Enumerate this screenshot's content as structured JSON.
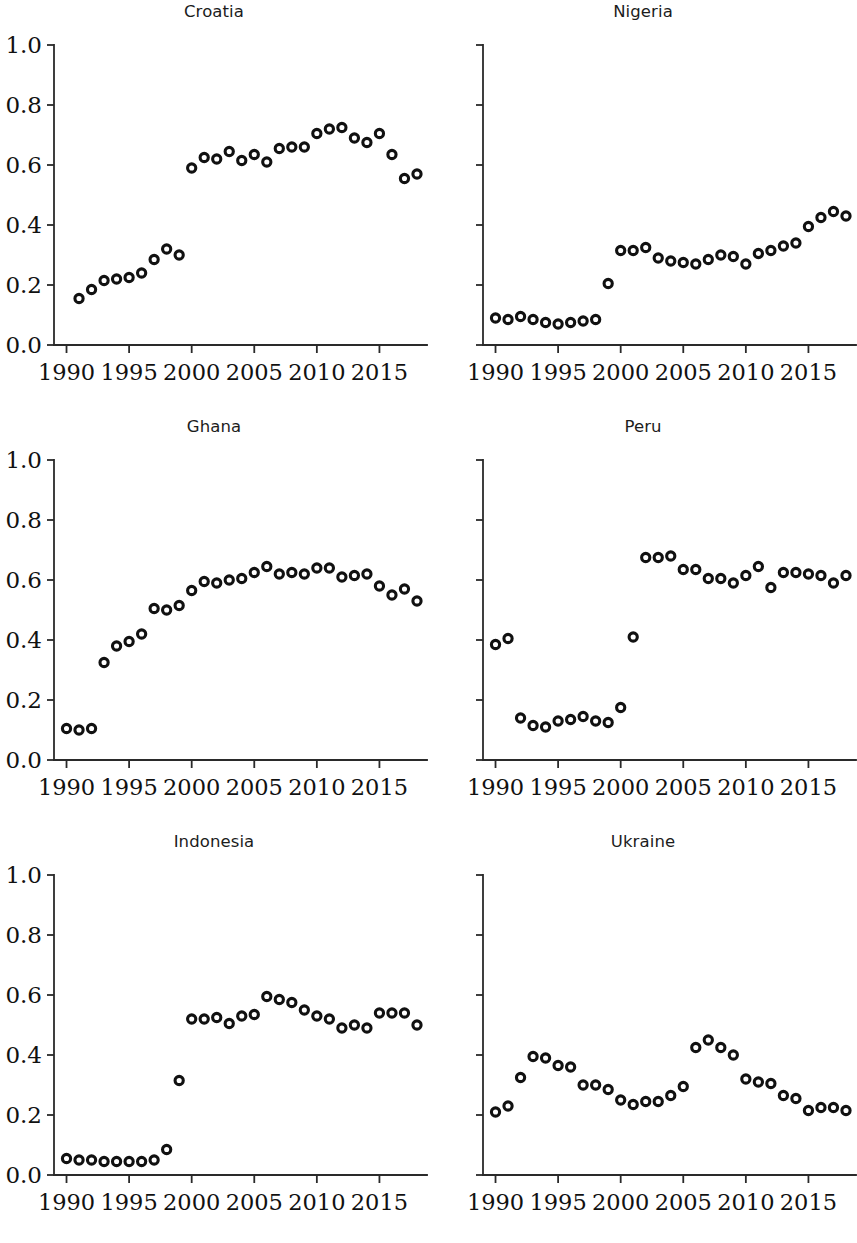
{
  "figure": {
    "layout": "2 columns x 3 rows of scatter panels",
    "panel_order": [
      "Croatia",
      "Nigeria",
      "Ghana",
      "Peru",
      "Indonesia",
      "Ukraine"
    ]
  },
  "axes": {
    "ylim": [
      0.0,
      1.0
    ],
    "ytick_labels": [
      "0.0",
      "0.2",
      "0.4",
      "0.6",
      "0.8",
      "1.0"
    ],
    "ytick_values": [
      0.0,
      0.2,
      0.4,
      0.6,
      0.8,
      1.0
    ],
    "xlim": [
      1989.0,
      2018.8
    ],
    "xtick_labels": [
      "1990",
      "1995",
      "2000",
      "2005",
      "2010",
      "2015"
    ],
    "xtick_values": [
      1990,
      1995,
      2000,
      2005,
      2010,
      2015
    ],
    "grid": false,
    "legend": "none",
    "marker_style": "open-circle",
    "marker_color": "#111111"
  },
  "chart_data": [
    {
      "type": "scatter",
      "title": "Croatia",
      "xlabel": "",
      "ylabel": "",
      "xlim": [
        1989.0,
        2018.8
      ],
      "ylim": [
        0.0,
        1.0
      ],
      "x": [
        1991,
        1992,
        1993,
        1994,
        1995,
        1996,
        1997,
        1998,
        1999,
        2000,
        2001,
        2002,
        2003,
        2004,
        2005,
        2006,
        2007,
        2008,
        2009,
        2010,
        2011,
        2012,
        2013,
        2014,
        2015,
        2016,
        2017,
        2018
      ],
      "y": [
        0.155,
        0.185,
        0.215,
        0.22,
        0.225,
        0.24,
        0.285,
        0.32,
        0.3,
        0.59,
        0.625,
        0.62,
        0.645,
        0.615,
        0.635,
        0.61,
        0.655,
        0.66,
        0.66,
        0.705,
        0.72,
        0.725,
        0.69,
        0.675,
        0.705,
        0.635,
        0.555,
        0.57
      ]
    },
    {
      "type": "scatter",
      "title": "Nigeria",
      "xlabel": "",
      "ylabel": "",
      "xlim": [
        1989.0,
        2018.8
      ],
      "ylim": [
        0.0,
        1.0
      ],
      "x": [
        1990,
        1991,
        1992,
        1993,
        1994,
        1995,
        1996,
        1997,
        1998,
        1999,
        2000,
        2001,
        2002,
        2003,
        2004,
        2005,
        2006,
        2007,
        2008,
        2009,
        2010,
        2011,
        2012,
        2013,
        2014,
        2015,
        2016,
        2017,
        2018
      ],
      "y": [
        0.09,
        0.085,
        0.095,
        0.085,
        0.075,
        0.07,
        0.075,
        0.08,
        0.085,
        0.205,
        0.315,
        0.315,
        0.325,
        0.29,
        0.28,
        0.275,
        0.27,
        0.285,
        0.3,
        0.295,
        0.27,
        0.305,
        0.315,
        0.33,
        0.34,
        0.395,
        0.425,
        0.445,
        0.43
      ]
    },
    {
      "type": "scatter",
      "title": "Ghana",
      "xlabel": "",
      "ylabel": "",
      "xlim": [
        1989.0,
        2018.8
      ],
      "ylim": [
        0.0,
        1.0
      ],
      "x": [
        1990,
        1991,
        1992,
        1993,
        1994,
        1995,
        1996,
        1997,
        1998,
        1999,
        2000,
        2001,
        2002,
        2003,
        2004,
        2005,
        2006,
        2007,
        2008,
        2009,
        2010,
        2011,
        2012,
        2013,
        2014,
        2015,
        2016,
        2017,
        2018
      ],
      "y": [
        0.105,
        0.1,
        0.105,
        0.325,
        0.38,
        0.395,
        0.42,
        0.505,
        0.5,
        0.515,
        0.565,
        0.595,
        0.59,
        0.6,
        0.605,
        0.625,
        0.645,
        0.62,
        0.625,
        0.62,
        0.64,
        0.64,
        0.61,
        0.615,
        0.62,
        0.58,
        0.55,
        0.57,
        0.53
      ]
    },
    {
      "type": "scatter",
      "title": "Peru",
      "xlabel": "",
      "ylabel": "",
      "xlim": [
        1989.0,
        2018.8
      ],
      "ylim": [
        0.0,
        1.0
      ],
      "x": [
        1990,
        1991,
        1992,
        1993,
        1994,
        1995,
        1996,
        1997,
        1998,
        1999,
        2000,
        2001,
        2002,
        2003,
        2004,
        2005,
        2006,
        2007,
        2008,
        2009,
        2010,
        2011,
        2012,
        2013,
        2014,
        2015,
        2016,
        2017,
        2018
      ],
      "y": [
        0.385,
        0.405,
        0.14,
        0.115,
        0.11,
        0.13,
        0.135,
        0.145,
        0.13,
        0.125,
        0.175,
        0.41,
        0.675,
        0.675,
        0.68,
        0.635,
        0.635,
        0.605,
        0.605,
        0.59,
        0.615,
        0.645,
        0.575,
        0.625,
        0.625,
        0.62,
        0.615,
        0.59,
        0.615
      ]
    },
    {
      "type": "scatter",
      "title": "Indonesia",
      "xlabel": "",
      "ylabel": "",
      "xlim": [
        1989.0,
        2018.8
      ],
      "ylim": [
        0.0,
        1.0
      ],
      "x": [
        1990,
        1991,
        1992,
        1993,
        1994,
        1995,
        1996,
        1997,
        1998,
        1999,
        2000,
        2001,
        2002,
        2003,
        2004,
        2005,
        2006,
        2007,
        2008,
        2009,
        2010,
        2011,
        2012,
        2013,
        2014,
        2015,
        2016,
        2017,
        2018
      ],
      "y": [
        0.055,
        0.05,
        0.05,
        0.045,
        0.045,
        0.045,
        0.045,
        0.05,
        0.085,
        0.315,
        0.52,
        0.52,
        0.525,
        0.505,
        0.53,
        0.535,
        0.595,
        0.585,
        0.575,
        0.55,
        0.53,
        0.52,
        0.49,
        0.5,
        0.49,
        0.54,
        0.54,
        0.54,
        0.5
      ]
    },
    {
      "type": "scatter",
      "title": "Ukraine",
      "xlabel": "",
      "ylabel": "",
      "xlim": [
        1989.0,
        2018.8
      ],
      "ylim": [
        0.0,
        1.0
      ],
      "x": [
        1990,
        1991,
        1992,
        1993,
        1994,
        1995,
        1996,
        1997,
        1998,
        1999,
        2000,
        2001,
        2002,
        2003,
        2004,
        2005,
        2006,
        2007,
        2008,
        2009,
        2010,
        2011,
        2012,
        2013,
        2014,
        2015,
        2016,
        2017,
        2018
      ],
      "y": [
        0.21,
        0.23,
        0.325,
        0.395,
        0.39,
        0.365,
        0.36,
        0.3,
        0.3,
        0.285,
        0.25,
        0.235,
        0.245,
        0.245,
        0.265,
        0.295,
        0.425,
        0.45,
        0.425,
        0.4,
        0.32,
        0.31,
        0.305,
        0.265,
        0.255,
        0.215,
        0.225,
        0.225,
        0.215
      ]
    }
  ]
}
